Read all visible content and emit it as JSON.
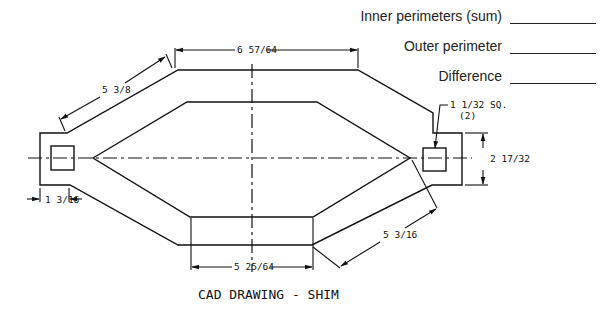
{
  "worksheet": {
    "answers": [
      {
        "label": "Inner perimeters (sum)",
        "value": ""
      },
      {
        "label": "Outer perimeter",
        "value": ""
      },
      {
        "label": "Difference",
        "value": ""
      }
    ]
  },
  "drawing": {
    "title": "CAD DRAWING - SHIM",
    "dimensions": {
      "top_width": "6 57/64",
      "upper_left_slope": "5 3/8",
      "tab_width": "1 3/16",
      "tab_height": "2 17/32",
      "square_callout": "1 1/32 SQ.",
      "square_count": "(2)",
      "bottom_width": "5 25/64",
      "lower_right_slope": "5 3/16"
    },
    "colors": {
      "line": "#111111",
      "background": "#ffffff"
    }
  }
}
